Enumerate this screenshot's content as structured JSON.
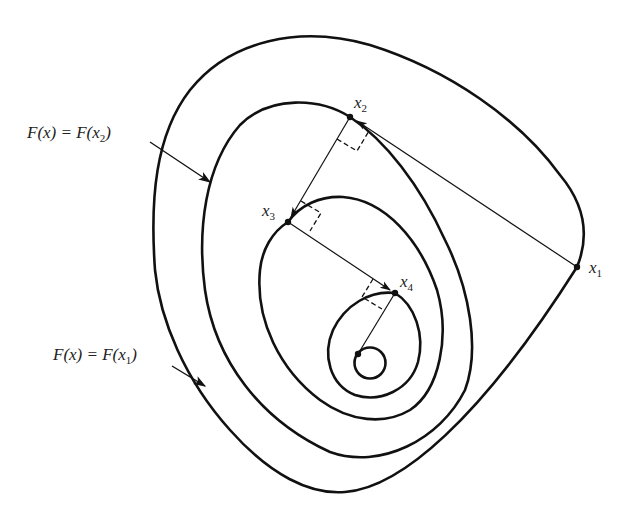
{
  "diagram": {
    "type": "contour-plot-steepest-descent",
    "contour_labels": [
      {
        "id": "level-x2",
        "text": "F(x) = F(x₂)",
        "prefix": "F(x) = F(x",
        "sub": "2",
        "suffix": ")"
      },
      {
        "id": "level-x1",
        "text": "F(x) = F(x₁)",
        "prefix": "F(x) = F(x",
        "sub": "1",
        "suffix": ")"
      }
    ],
    "points": [
      {
        "id": "x1",
        "base": "x",
        "sub": "1"
      },
      {
        "id": "x2",
        "base": "x",
        "sub": "2"
      },
      {
        "id": "x3",
        "base": "x",
        "sub": "3"
      },
      {
        "id": "x4",
        "base": "x",
        "sub": "4"
      }
    ],
    "steps": [
      {
        "from": "x1",
        "to": "x2"
      },
      {
        "from": "x2",
        "to": "x3"
      },
      {
        "from": "x3",
        "to": "x4"
      },
      {
        "from": "x4",
        "to": "minimum"
      }
    ],
    "colors": {
      "ink": "#111111",
      "background": "#ffffff"
    }
  }
}
